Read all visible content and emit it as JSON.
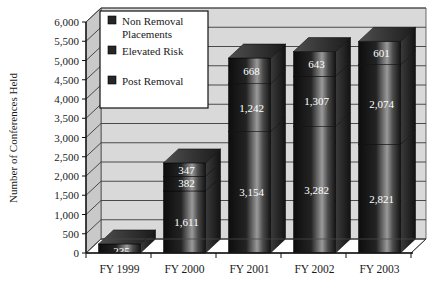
{
  "chart_data": {
    "type": "bar",
    "subtype": "stacked-3d-column",
    "title": "",
    "xlabel": "",
    "ylabel": "Number of Conferences Held",
    "categories": [
      "FY 1999",
      "FY 2000",
      "FY 2001",
      "FY 2002",
      "FY 2003"
    ],
    "ylim": [
      0,
      6000
    ],
    "ytick_step": 500,
    "ytick_labels": [
      "0",
      "500",
      "1,000",
      "1,500",
      "2,000",
      "2,500",
      "3,000",
      "3,500",
      "4,000",
      "4,500",
      "5,000",
      "5,500",
      "6,000"
    ],
    "grid": true,
    "legend_position": "top-left-inside",
    "series": [
      {
        "name": "Post Removal",
        "values": [
          235,
          1611,
          3154,
          3282,
          2821
        ],
        "labels": [
          "235",
          "1,611",
          "3,154",
          "3,282",
          "2,821"
        ],
        "color": "#1c1c1c"
      },
      {
        "name": "Elevated Risk",
        "values": [
          0,
          382,
          1242,
          1307,
          2074
        ],
        "labels": [
          "",
          "382",
          "1,242",
          "1,307",
          "2,074"
        ],
        "color": "#272727"
      },
      {
        "name": "Non Removal Placements",
        "values": [
          0,
          347,
          668,
          643,
          601
        ],
        "labels": [
          "",
          "347",
          "668",
          "643",
          "601"
        ],
        "color": "#333333"
      }
    ]
  },
  "legend": {
    "items": [
      {
        "label_line1": "Non Removal",
        "label_line2": "Placements",
        "swatch": "#262626"
      },
      {
        "label_line1": "Elevated Risk",
        "label_line2": "",
        "swatch": "#262626"
      },
      {
        "label_line1": "Post Removal",
        "label_line2": "",
        "swatch": "#262626"
      }
    ]
  },
  "axis": {
    "y_title": "Number of Conferences Held"
  },
  "colors": {
    "plot_background": "#d9d9d9",
    "wall_side": "#c9c9c9",
    "floor": "#bdbdbd",
    "gridline": "#3a3a3a",
    "axis_line": "#111111",
    "bar_front_dark": "#101010",
    "bar_front_light": "#8a8a8a",
    "bar_side": "#2a2a2a",
    "bar_top": "#4a4a4a",
    "legend_bg": "#ffffff",
    "legend_border": "#111111",
    "text": "#1a1a1a",
    "data_label": "#ffffff"
  }
}
